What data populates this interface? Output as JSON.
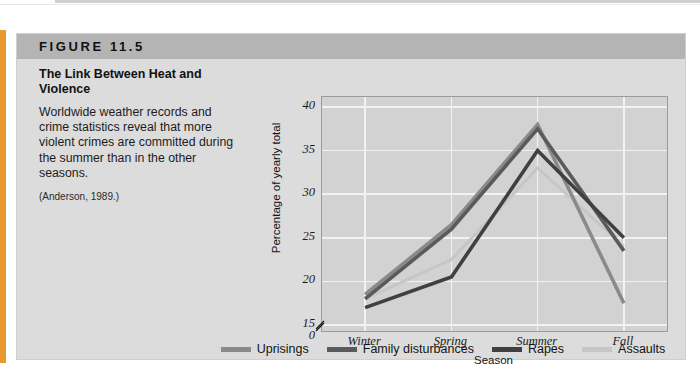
{
  "figure": {
    "header_label": "FIGURE 11.5",
    "caption_title": "The Link Between Heat and Violence",
    "caption_body": "Worldwide weather records and crime statistics reveal that more violent crimes are committed during the summer than in the other seasons.",
    "caption_source": "(Anderson, 1989.)"
  },
  "colors": {
    "panel_bg": "#dcdcdc",
    "header_bg": "#b4b4b4",
    "plot_bg": "#d2d2d2",
    "grid": "#f2f2f2",
    "orange_edge": "#e8982f",
    "uprisings": "#8a8a8a",
    "family_disturbances": "#5a5a5a",
    "rapes": "#404040",
    "assaults": "#c6c6c6"
  },
  "chart_data": {
    "type": "line",
    "title": "The Link Between Heat and Violence",
    "xlabel": "Season",
    "ylabel": "Percentage of yearly total",
    "categories": [
      "Winter",
      "Spring",
      "Summer",
      "Fall"
    ],
    "ylim": [
      15,
      40
    ],
    "yticks": [
      "0",
      "15",
      "20",
      "25",
      "30",
      "35",
      "40"
    ],
    "ytick_values": [
      0,
      15,
      20,
      25,
      30,
      35,
      40
    ],
    "axis_break": true,
    "grid": true,
    "legend_position": "bottom",
    "series": [
      {
        "name": "Uprisings",
        "values": [
          18.5,
          26.5,
          38.0,
          17.5
        ]
      },
      {
        "name": "Family disturbances",
        "values": [
          18.0,
          26.0,
          37.5,
          23.5
        ]
      },
      {
        "name": "Rapes",
        "values": [
          17.0,
          20.5,
          35.0,
          25.0
        ]
      },
      {
        "name": "Assaults",
        "values": [
          18.0,
          22.5,
          33.0,
          24.0
        ]
      }
    ]
  }
}
